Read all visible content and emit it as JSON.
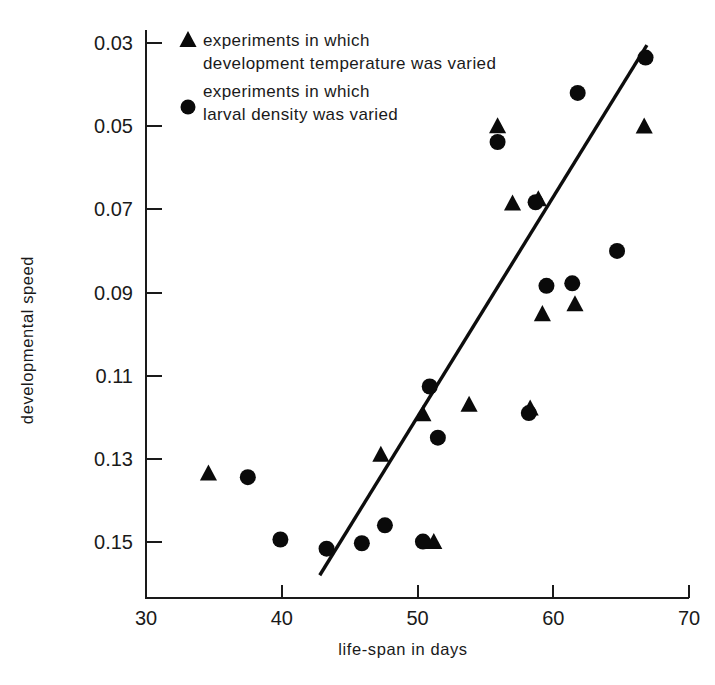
{
  "chart_data": {
    "type": "scatter",
    "title": "",
    "xlabel": "life-span in days",
    "ylabel": "developmental speed",
    "xlim": [
      30,
      70
    ],
    "ylim": [
      0.03,
      0.15
    ],
    "y_axis_inverted": true,
    "grid": false,
    "xticks": [
      30,
      40,
      50,
      60,
      70
    ],
    "xtick_labels": [
      "30",
      "40",
      "50",
      "60",
      "70"
    ],
    "yticks": [
      0.03,
      0.05,
      0.07,
      0.09,
      0.11,
      0.13,
      0.15
    ],
    "ytick_labels": [
      "0.03",
      "0.05",
      "0.07",
      "0.09",
      "0.11",
      "0.13",
      "0.15"
    ],
    "legend_position": "top-left-inside",
    "series": [
      {
        "name": "experiments in which development temperature was varied",
        "marker": "triangle",
        "color": "#0a0a0a",
        "points": [
          {
            "x": 34.6,
            "y": 0.1335
          },
          {
            "x": 47.3,
            "y": 0.129
          },
          {
            "x": 50.4,
            "y": 0.1193
          },
          {
            "x": 51.2,
            "y": 0.15
          },
          {
            "x": 53.8,
            "y": 0.117
          },
          {
            "x": 55.9,
            "y": 0.05
          },
          {
            "x": 57.0,
            "y": 0.0686
          },
          {
            "x": 58.3,
            "y": 0.1179
          },
          {
            "x": 58.9,
            "y": 0.0676
          },
          {
            "x": 59.2,
            "y": 0.0952
          },
          {
            "x": 61.6,
            "y": 0.0928
          },
          {
            "x": 66.7,
            "y": 0.0501
          }
        ]
      },
      {
        "name": "experiments in which larval density was varied",
        "marker": "circle",
        "color": "#0a0a0a",
        "points": [
          {
            "x": 37.5,
            "y": 0.1344
          },
          {
            "x": 39.9,
            "y": 0.1494
          },
          {
            "x": 43.3,
            "y": 0.1516
          },
          {
            "x": 45.9,
            "y": 0.1503
          },
          {
            "x": 47.6,
            "y": 0.146
          },
          {
            "x": 50.4,
            "y": 0.1499
          },
          {
            "x": 51.5,
            "y": 0.1249
          },
          {
            "x": 50.9,
            "y": 0.1126
          },
          {
            "x": 55.9,
            "y": 0.0538
          },
          {
            "x": 58.2,
            "y": 0.119
          },
          {
            "x": 58.7,
            "y": 0.0683
          },
          {
            "x": 59.5,
            "y": 0.0884
          },
          {
            "x": 61.4,
            "y": 0.0878
          },
          {
            "x": 61.8,
            "y": 0.042
          },
          {
            "x": 64.7,
            "y": 0.08
          },
          {
            "x": 66.8,
            "y": 0.0335
          }
        ]
      }
    ],
    "fit_line": {
      "name": "regression line",
      "x_start": 42.8,
      "y_start": 0.158,
      "x_end": 66.9,
      "y_end": 0.0305
    }
  },
  "legend": {
    "entries": [
      {
        "marker": "triangle",
        "line1": "experiments in which",
        "line2": "development temperature was varied"
      },
      {
        "marker": "circle",
        "line1": "experiments in which",
        "line2": "larval density was varied"
      }
    ]
  },
  "colors": {
    "marker": "#0a0a0a",
    "axis": "#1a1a1a",
    "background": "#ffffff"
  }
}
